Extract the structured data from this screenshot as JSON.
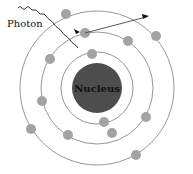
{
  "diagram": {
    "type": "bohr-atom",
    "labels": {
      "photon": "Photon",
      "nucleus": "Nucleus"
    },
    "colors": {
      "nucleus": "#4d4d4d",
      "electron": "#a3a3a3",
      "orbit": "#8a8a8a",
      "text": "#111111"
    },
    "nucleus": {
      "cx": 97,
      "cy": 88,
      "r": 25
    },
    "orbits": [
      {
        "r": 36
      },
      {
        "r": 56
      },
      {
        "r": 77
      }
    ],
    "electrons": [
      {
        "cx": 92,
        "cy": 54
      },
      {
        "cx": 104,
        "cy": 122
      },
      {
        "cx": 85,
        "cy": 33
      },
      {
        "cx": 128,
        "cy": 41
      },
      {
        "cx": 50,
        "cy": 59
      },
      {
        "cx": 42,
        "cy": 101
      },
      {
        "cx": 68,
        "cy": 135
      },
      {
        "cx": 112,
        "cy": 133
      },
      {
        "cx": 146,
        "cy": 117
      },
      {
        "cx": 66,
        "cy": 14
      },
      {
        "cx": 156,
        "cy": 36
      },
      {
        "cx": 31,
        "cy": 129
      },
      {
        "cx": 136,
        "cy": 155
      }
    ]
  }
}
